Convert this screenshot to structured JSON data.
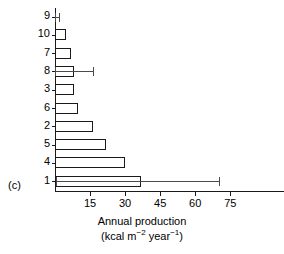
{
  "panel": {
    "label": "(c)"
  },
  "axis": {
    "title_line1": "Annual production",
    "title_line2_pre": "(kcal m",
    "title_line2_sup1": "−2",
    "title_line2_mid": " year",
    "title_line2_sup2": "−1",
    "title_line2_post": ")",
    "x_ticks": [
      "15",
      "30",
      "45",
      "60",
      "75"
    ],
    "y_labels": [
      "9",
      "10",
      "7",
      "8",
      "3",
      "6",
      "2",
      "5",
      "4",
      "1"
    ]
  },
  "colors": {
    "axis": "#1a1a1a",
    "bar_stroke": "#1a1a1a",
    "bar_fill": "#ffffff",
    "error": "#4a4a4a",
    "background": "#ffffff"
  },
  "chart_data": {
    "type": "bar",
    "orientation": "horizontal",
    "title": "",
    "xlabel": "Annual production (kcal m−2 year−1)",
    "ylabel": "",
    "xlim": [
      0,
      98
    ],
    "grid": false,
    "legend": false,
    "categories": [
      "9",
      "10",
      "7",
      "8",
      "3",
      "6",
      "2",
      "5",
      "4",
      "1"
    ],
    "values": [
      0.2,
      4.7,
      6.9,
      8.1,
      8.1,
      9.9,
      16.2,
      22.0,
      29.8,
      37.0
    ],
    "error_high": [
      1.5,
      null,
      null,
      16.2,
      null,
      null,
      null,
      null,
      null,
      70.0
    ],
    "error_low": [
      0.0,
      null,
      null,
      0.0,
      null,
      null,
      null,
      null,
      null,
      0.5
    ],
    "series": [
      {
        "name": "Annual production",
        "values": [
          0.2,
          4.7,
          6.9,
          8.1,
          8.1,
          9.9,
          16.2,
          22.0,
          29.8,
          37.0
        ]
      }
    ],
    "x_ticks": [
      15,
      30,
      45,
      60,
      75
    ]
  }
}
